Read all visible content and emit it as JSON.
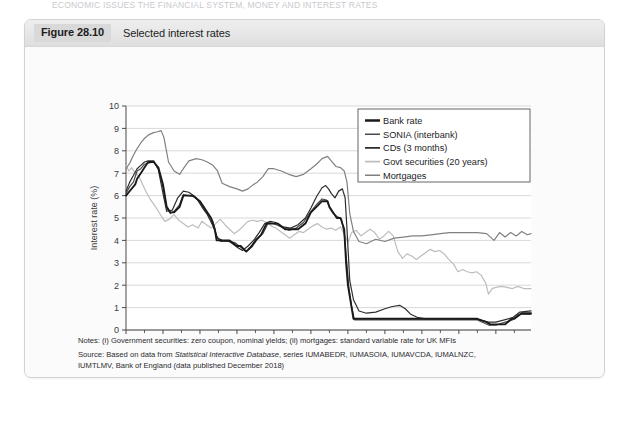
{
  "page_header": "ECONOMIC ISSUES  THE FINANCIAL SYSTEM, MONEY AND INTEREST RATES",
  "figure": {
    "number": "Figure 28.10",
    "caption": "Selected interest rates"
  },
  "notes": {
    "line1": "Notes: (i) Government securities: zero coupon, nominal yields; (ii) mortgages: standard variable rate for UK MFIs",
    "line2_prefix": "Source: Based on data from ",
    "line2_italic": "Statistical Interactive Database",
    "line2_suffix": ", series IUMABEDR, IUMASOIA, IUMAVCDA, IUMALNZC,",
    "line3": "IUMTLMV, Bank of England (data published December 2018)"
  },
  "colors": {
    "bank_rate": "#1a1a1a",
    "sonia": "#4a4a4a",
    "cds": "#2e2e2e",
    "govt_securities": "#bdbdbd",
    "mortgages": "#808080",
    "gridline": "#c9c9cb",
    "axis": "#4a4a4a",
    "plot_background": "#ffffff",
    "card_background": "#fbfbfb",
    "titlebar_background": "#e6e6e6",
    "figure_number_background": "#d9d9d9"
  },
  "chart_data": {
    "type": "line",
    "title": "Selected interest rates",
    "xlabel": "",
    "ylabel": "Interest rate (%)",
    "xlim": [
      1997,
      2018.9
    ],
    "ylim": [
      0,
      10
    ],
    "grid": true,
    "legend_position": "top-right",
    "ytick_labels": [
      "0",
      "1",
      "2",
      "3",
      "4",
      "5",
      "6",
      "7",
      "8",
      "9",
      "10"
    ],
    "ytick_values": [
      0,
      1,
      2,
      3,
      4,
      5,
      6,
      7,
      8,
      9,
      10
    ],
    "xtick_labels": [
      "1997",
      "1999",
      "2001",
      "2003",
      "2005",
      "2007",
      "2009",
      "2011",
      "2013",
      "2015",
      "2017"
    ],
    "xtick_values": [
      1997,
      1999,
      2001,
      2003,
      2005,
      2007,
      2009,
      2011,
      2013,
      2015,
      2017
    ],
    "xminor_values": [
      1998,
      2000,
      2002,
      2004,
      2006,
      2008,
      2010,
      2012,
      2014,
      2016,
      2018
    ],
    "series": [
      {
        "name": "Bank rate",
        "color": "#1a1a1a",
        "width": 1.9,
        "x": [
          1997.0,
          1997.25,
          1997.5,
          1997.6,
          1997.8,
          1998.0,
          1998.2,
          1998.5,
          1998.75,
          1999.0,
          1999.2,
          1999.4,
          1999.6,
          1999.9,
          2000.1,
          2000.3,
          2000.6,
          2001.0,
          2001.2,
          2001.4,
          2001.6,
          2001.8,
          2001.9,
          2002.2,
          2002.6,
          2003.0,
          2003.2,
          2003.5,
          2003.8,
          2004.0,
          2004.3,
          2004.6,
          2004.9,
          2005.2,
          2005.6,
          2005.9,
          2006.3,
          2006.7,
          2007.0,
          2007.3,
          2007.6,
          2007.9,
          2008.0,
          2008.2,
          2008.4,
          2008.6,
          2008.8,
          2008.9,
          2009.0,
          2009.1,
          2009.2,
          2009.3,
          2009.5,
          2010.0,
          2011.0,
          2012.0,
          2013.0,
          2014.0,
          2015.0,
          2016.0,
          2016.5,
          2016.7,
          2017.0,
          2017.5,
          2017.85,
          2018.0,
          2018.4,
          2018.9
        ],
        "y": [
          6.0,
          6.25,
          6.5,
          6.75,
          7.0,
          7.25,
          7.5,
          7.5,
          7.25,
          6.5,
          5.5,
          5.25,
          5.25,
          5.5,
          6.0,
          6.0,
          6.0,
          5.75,
          5.5,
          5.25,
          5.0,
          4.5,
          4.0,
          4.0,
          4.0,
          3.75,
          3.75,
          3.5,
          3.75,
          4.0,
          4.25,
          4.75,
          4.75,
          4.75,
          4.5,
          4.5,
          4.5,
          4.75,
          5.25,
          5.5,
          5.75,
          5.75,
          5.5,
          5.25,
          5.0,
          5.0,
          4.5,
          3.0,
          2.0,
          1.5,
          1.0,
          0.5,
          0.5,
          0.5,
          0.5,
          0.5,
          0.5,
          0.5,
          0.5,
          0.5,
          0.35,
          0.25,
          0.25,
          0.25,
          0.5,
          0.5,
          0.75,
          0.75
        ]
      },
      {
        "name": "SONIA (interbank)",
        "color": "#4a4a4a",
        "width": 1.2,
        "x": [
          1997.0,
          1997.2,
          1997.4,
          1997.6,
          1997.8,
          1998.0,
          1998.2,
          1998.5,
          1998.75,
          1999.0,
          1999.2,
          1999.4,
          1999.6,
          1999.9,
          2000.1,
          2000.4,
          2000.7,
          2001.0,
          2001.2,
          2001.5,
          2001.7,
          2001.9,
          2002.1,
          2002.5,
          2002.9,
          2003.2,
          2003.5,
          2003.8,
          2004.1,
          2004.4,
          2004.7,
          2005.0,
          2005.4,
          2005.8,
          2006.2,
          2006.6,
          2007.0,
          2007.3,
          2007.6,
          2007.85,
          2008.0,
          2008.2,
          2008.45,
          2008.65,
          2008.8,
          2008.95,
          2009.05,
          2009.2,
          2009.35,
          2009.6,
          2010.0,
          2011.0,
          2012.0,
          2013.0,
          2014.0,
          2015.0,
          2016.0,
          2016.6,
          2017.0,
          2017.9,
          2018.2,
          2018.9
        ],
        "y": [
          6.1,
          6.4,
          6.6,
          7.1,
          7.2,
          7.4,
          7.45,
          7.5,
          7.2,
          6.4,
          5.45,
          5.2,
          5.3,
          5.6,
          6.05,
          6.0,
          5.95,
          5.7,
          5.45,
          5.1,
          4.85,
          4.2,
          3.95,
          3.95,
          3.9,
          3.7,
          3.5,
          3.7,
          4.05,
          4.3,
          4.8,
          4.75,
          4.6,
          4.45,
          4.55,
          4.8,
          5.3,
          5.6,
          5.85,
          5.8,
          5.45,
          5.2,
          5.05,
          4.95,
          4.3,
          2.9,
          1.9,
          1.05,
          0.45,
          0.45,
          0.45,
          0.45,
          0.45,
          0.45,
          0.45,
          0.45,
          0.45,
          0.22,
          0.22,
          0.45,
          0.7,
          0.7
        ]
      },
      {
        "name": "CDs (3 months)",
        "color": "#2e2e2e",
        "width": 1.2,
        "x": [
          1997.0,
          1997.2,
          1997.4,
          1997.6,
          1997.8,
          1998.0,
          1998.2,
          1998.5,
          1998.75,
          1999.0,
          1999.2,
          1999.5,
          1999.8,
          2000.1,
          2000.4,
          2000.8,
          2001.1,
          2001.4,
          2001.7,
          2001.95,
          2002.2,
          2002.6,
          2003.0,
          2003.3,
          2003.6,
          2003.9,
          2004.2,
          2004.5,
          2004.8,
          2005.1,
          2005.5,
          2005.9,
          2006.3,
          2006.7,
          2007.0,
          2007.3,
          2007.6,
          2007.8,
          2007.95,
          2008.1,
          2008.3,
          2008.5,
          2008.7,
          2008.85,
          2008.95,
          2009.1,
          2009.3,
          2009.6,
          2010.0,
          2010.5,
          2011.0,
          2011.4,
          2011.8,
          2012.1,
          2012.4,
          2012.8,
          2013.2,
          2014.0,
          2015.0,
          2016.0,
          2016.6,
          2017.0,
          2017.9,
          2018.3,
          2018.9
        ],
        "y": [
          6.2,
          6.6,
          6.9,
          7.2,
          7.35,
          7.5,
          7.55,
          7.55,
          7.15,
          6.1,
          5.3,
          5.35,
          5.9,
          6.2,
          6.15,
          5.9,
          5.5,
          5.15,
          4.65,
          4.1,
          4.0,
          3.95,
          3.7,
          3.55,
          3.75,
          4.0,
          4.35,
          4.75,
          4.85,
          4.8,
          4.6,
          4.55,
          4.7,
          5.0,
          5.45,
          5.95,
          6.35,
          6.45,
          6.3,
          6.1,
          5.9,
          6.2,
          6.3,
          5.9,
          4.5,
          2.2,
          1.35,
          0.85,
          0.75,
          0.8,
          0.95,
          1.05,
          1.1,
          0.95,
          0.7,
          0.55,
          0.5,
          0.5,
          0.5,
          0.48,
          0.35,
          0.35,
          0.55,
          0.8,
          0.85
        ]
      },
      {
        "name": "Govt securities (20 years)",
        "color": "#bdbdbd",
        "width": 1.2,
        "x": [
          1997.0,
          1997.15,
          1997.3,
          1997.5,
          1997.7,
          1997.9,
          1998.1,
          1998.3,
          1998.6,
          1998.9,
          1999.1,
          1999.35,
          1999.6,
          1999.85,
          2000.1,
          2000.35,
          2000.6,
          2000.9,
          2001.1,
          2001.35,
          2001.6,
          2001.85,
          2002.1,
          2002.35,
          2002.6,
          2002.85,
          2003.1,
          2003.35,
          2003.6,
          2003.85,
          2004.1,
          2004.35,
          2004.6,
          2004.85,
          2005.1,
          2005.35,
          2005.6,
          2005.85,
          2006.1,
          2006.35,
          2006.6,
          2006.85,
          2007.1,
          2007.35,
          2007.6,
          2007.85,
          2008.1,
          2008.35,
          2008.6,
          2008.85,
          2009.0,
          2009.2,
          2009.45,
          2009.7,
          2009.95,
          2010.2,
          2010.45,
          2010.7,
          2010.95,
          2011.2,
          2011.45,
          2011.7,
          2011.95,
          2012.2,
          2012.45,
          2012.7,
          2012.95,
          2013.2,
          2013.45,
          2013.7,
          2013.95,
          2014.2,
          2014.45,
          2014.7,
          2014.95,
          2015.2,
          2015.45,
          2015.7,
          2015.95,
          2016.2,
          2016.45,
          2016.6,
          2016.8,
          2017.0,
          2017.3,
          2017.6,
          2017.9,
          2018.2,
          2018.5,
          2018.9
        ],
        "y": [
          7.35,
          7.1,
          7.25,
          7.0,
          6.85,
          6.5,
          6.15,
          5.85,
          5.5,
          5.1,
          4.85,
          4.95,
          5.15,
          4.9,
          4.75,
          4.6,
          4.7,
          4.55,
          4.85,
          4.7,
          4.55,
          4.75,
          4.95,
          4.7,
          4.5,
          4.3,
          4.45,
          4.65,
          4.85,
          4.9,
          4.85,
          4.9,
          4.8,
          4.65,
          4.55,
          4.4,
          4.25,
          4.1,
          4.25,
          4.4,
          4.35,
          4.5,
          4.65,
          4.75,
          4.6,
          4.5,
          4.55,
          4.45,
          4.6,
          4.2,
          3.9,
          4.35,
          4.45,
          4.2,
          4.35,
          4.5,
          4.35,
          4.05,
          4.2,
          4.4,
          4.2,
          3.5,
          3.2,
          3.4,
          3.3,
          3.15,
          3.3,
          3.45,
          3.6,
          3.5,
          3.55,
          3.4,
          3.15,
          2.95,
          2.6,
          2.7,
          2.6,
          2.55,
          2.6,
          2.45,
          2.1,
          1.6,
          1.85,
          1.9,
          1.95,
          1.9,
          1.85,
          1.95,
          1.85,
          1.85
        ]
      },
      {
        "name": "Mortgages",
        "color": "#808080",
        "width": 1.2,
        "x": [
          1997.0,
          1997.2,
          1997.4,
          1997.6,
          1997.8,
          1998.0,
          1998.2,
          1998.45,
          1998.7,
          1998.9,
          1999.05,
          1999.3,
          1999.6,
          1999.9,
          2000.1,
          2000.4,
          2000.8,
          2001.1,
          2001.4,
          2001.7,
          2001.95,
          2002.2,
          2002.6,
          2003.0,
          2003.3,
          2003.6,
          2003.9,
          2004.1,
          2004.4,
          2004.7,
          2005.0,
          2005.4,
          2005.8,
          2006.2,
          2006.6,
          2007.0,
          2007.3,
          2007.6,
          2007.9,
          2008.1,
          2008.35,
          2008.6,
          2008.8,
          2008.95,
          2009.1,
          2009.3,
          2009.6,
          2010.0,
          2010.5,
          2011.0,
          2011.5,
          2012.0,
          2012.5,
          2013.0,
          2013.5,
          2014.0,
          2014.5,
          2015.0,
          2015.5,
          2016.0,
          2016.5,
          2016.9,
          2017.2,
          2017.5,
          2017.8,
          2018.1,
          2018.4,
          2018.7,
          2018.9
        ],
        "y": [
          7.2,
          7.45,
          7.8,
          8.1,
          8.35,
          8.55,
          8.7,
          8.8,
          8.85,
          8.9,
          8.6,
          7.5,
          7.1,
          6.95,
          7.2,
          7.55,
          7.65,
          7.6,
          7.5,
          7.35,
          7.1,
          6.55,
          6.4,
          6.3,
          6.2,
          6.3,
          6.5,
          6.6,
          6.85,
          7.2,
          7.2,
          7.1,
          6.95,
          6.85,
          6.95,
          7.2,
          7.4,
          7.65,
          7.75,
          7.55,
          7.3,
          7.25,
          7.1,
          6.6,
          5.2,
          4.4,
          3.95,
          3.85,
          4.05,
          3.95,
          4.1,
          4.15,
          4.2,
          4.2,
          4.25,
          4.3,
          4.35,
          4.35,
          4.35,
          4.35,
          4.3,
          4.0,
          4.35,
          4.15,
          4.35,
          4.2,
          4.4,
          4.25,
          4.3
        ]
      }
    ]
  }
}
